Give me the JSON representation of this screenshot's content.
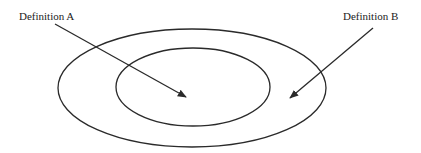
{
  "diagram": {
    "type": "nested-ellipses",
    "labels": {
      "a": "Definition A",
      "b": "Definition B"
    },
    "colors": {
      "stroke": "#2a2a2a",
      "text": "#222222",
      "background": "#ffffff"
    }
  }
}
